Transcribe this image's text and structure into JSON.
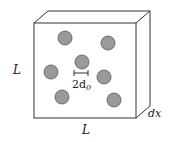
{
  "diagram": {
    "type": "slab-with-particles",
    "labels": {
      "height": "L",
      "width": "L",
      "thickness": "dx",
      "spacing_base": "2d",
      "spacing_sub": "0"
    },
    "colors": {
      "stroke": "#333333",
      "particle_fill": "#9a9a9a",
      "particle_stroke": "#555555",
      "background": "#ffffff"
    },
    "front_face": {
      "x": 34,
      "y": 23,
      "w": 102,
      "h": 95
    },
    "depth_offset": {
      "dx": 14,
      "dy": -12
    },
    "particles": [
      {
        "cx": 65,
        "cy": 38,
        "r": 7
      },
      {
        "cx": 108,
        "cy": 43,
        "r": 7
      },
      {
        "cx": 82,
        "cy": 62,
        "r": 7
      },
      {
        "cx": 51,
        "cy": 72,
        "r": 7
      },
      {
        "cx": 104,
        "cy": 77,
        "r": 7
      },
      {
        "cx": 62,
        "cy": 97,
        "r": 7
      },
      {
        "cx": 114,
        "cy": 100,
        "r": 7
      }
    ]
  }
}
